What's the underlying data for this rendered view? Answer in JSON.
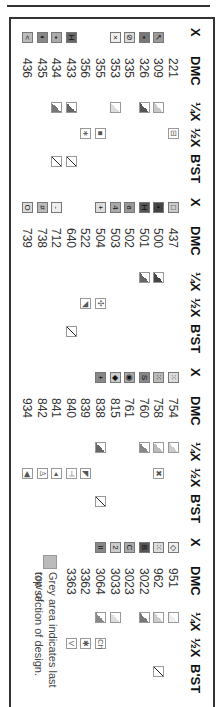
{
  "headers": {
    "x": "X",
    "dmc": "DMC",
    "quarter": "¼X",
    "half": "½X",
    "bst": "B'ST"
  },
  "groups": [
    {
      "rows": [
        {
          "dmc": "221",
          "x": null,
          "x_bg": null,
          "q": null,
          "h": "⊟",
          "b": false
        },
        {
          "dmc": "309",
          "x": "↖",
          "x_bg": "#9a9a9a",
          "q": "#c8c8c8",
          "h": null,
          "b": false
        },
        {
          "dmc": "326",
          "x": "•",
          "x_bg": "#777",
          "q": "#555",
          "h": null,
          "b": false
        },
        {
          "dmc": "335",
          "x": "⊘",
          "x_bg": "#ddd",
          "q": null,
          "h": null,
          "b": false
        },
        {
          "dmc": "353",
          "x": "×",
          "x_bg": "#eee",
          "q": "#ddd",
          "h": null,
          "b": false
        },
        {
          "dmc": "355",
          "x": null,
          "x_bg": null,
          "q": null,
          "h": "■",
          "b": false
        },
        {
          "dmc": "356",
          "x": null,
          "x_bg": null,
          "q": null,
          "h": "∗",
          "b": false
        },
        {
          "dmc": "433",
          "x": "H",
          "x_bg": "#666",
          "q": "#666",
          "h": null,
          "b": true
        },
        {
          "dmc": "434",
          "x": "•",
          "x_bg": "#aaa",
          "q": "#777",
          "h": null,
          "b": true
        },
        {
          "dmc": "435",
          "x": "◐",
          "x_bg": "#888",
          "q": null,
          "h": null,
          "b": false
        },
        {
          "dmc": "436",
          "x": "<",
          "x_bg": "#bbb",
          "q": null,
          "h": null,
          "b": false
        }
      ]
    },
    {
      "rows": [
        {
          "dmc": "437",
          "x": "□",
          "x_bg": "#ccc",
          "q": null,
          "h": null,
          "b": false
        },
        {
          "dmc": "500",
          "x": "▪",
          "x_bg": "#444",
          "q": "#444",
          "h": null,
          "b": false
        },
        {
          "dmc": "501",
          "x": "H",
          "x_bg": "#555",
          "q": "#666",
          "h": null,
          "b": false
        },
        {
          "dmc": "502",
          "x": "ɞ",
          "x_bg": "#999",
          "q": null,
          "h": null,
          "b": false
        },
        {
          "dmc": "503",
          "x": "4",
          "x_bg": "#aaa",
          "q": null,
          "h": null,
          "b": false
        },
        {
          "dmc": "504",
          "x": "+",
          "x_bg": "#ddd",
          "q": null,
          "h": "✣",
          "b": false
        },
        {
          "dmc": "522",
          "x": null,
          "x_bg": null,
          "q": null,
          "h": "◥",
          "b": false
        },
        {
          "dmc": "640",
          "x": null,
          "x_bg": null,
          "q": null,
          "h": null,
          "b": true
        },
        {
          "dmc": "712",
          "x": "-",
          "x_bg": "#eee",
          "q": null,
          "h": null,
          "b": false
        },
        {
          "dmc": "738",
          "x": "#",
          "x_bg": "#bbb",
          "q": null,
          "h": null,
          "b": false
        },
        {
          "dmc": "739",
          "x": "O",
          "x_bg": "#ddd",
          "q": null,
          "h": null,
          "b": false
        }
      ]
    },
    {
      "rows": [
        {
          "dmc": "754",
          "x": "⁙",
          "x_bg": "#ddd",
          "q": "#ccc",
          "h": null,
          "b": false
        },
        {
          "dmc": "758",
          "x": "⁙",
          "x_bg": "#bbb",
          "q": "#bbb",
          "h": "✖",
          "b": false
        },
        {
          "dmc": "760",
          "x": "S",
          "x_bg": "#888",
          "q": "#888",
          "h": null,
          "b": false
        },
        {
          "dmc": "761",
          "x": "◉",
          "x_bg": "#aaa",
          "q": null,
          "h": null,
          "b": false
        },
        {
          "dmc": "815",
          "x": "◆",
          "x_bg": "#ccc",
          "q": null,
          "h": null,
          "b": false
        },
        {
          "dmc": "838",
          "x": "+",
          "x_bg": "#888",
          "q": "#666",
          "h": null,
          "b": true
        },
        {
          "dmc": "839",
          "x": null,
          "x_bg": null,
          "q": null,
          "h": "◤",
          "b": false
        },
        {
          "dmc": "840",
          "x": null,
          "x_bg": null,
          "q": null,
          "h": "⊣",
          "b": false
        },
        {
          "dmc": "841",
          "x": null,
          "x_bg": null,
          "q": null,
          "h": "◂",
          "b": false
        },
        {
          "dmc": "842",
          "x": null,
          "x_bg": null,
          "q": null,
          "h": "♙",
          "b": false
        },
        {
          "dmc": "934",
          "x": null,
          "x_bg": null,
          "q": null,
          "h": "◀",
          "b": false
        }
      ]
    },
    {
      "rows": [
        {
          "dmc": "951",
          "x": "◇",
          "x_bg": "#eee",
          "q": "#eee",
          "h": null,
          "b": false
        },
        {
          "dmc": "962",
          "x": "⁙",
          "x_bg": "#ddd",
          "q": "#ccc",
          "h": null,
          "b": true
        },
        {
          "dmc": "3022",
          "x": "B",
          "x_bg": "#555",
          "q": "#777",
          "h": null,
          "b": false
        },
        {
          "dmc": "3023",
          "x": "C",
          "x_bg": "#aaa",
          "q": null,
          "h": null,
          "b": false
        },
        {
          "dmc": "3033",
          "x": "2",
          "x_bg": "#ccc",
          "q": "#ddd",
          "h": null,
          "b": false
        },
        {
          "dmc": "3064",
          "x": "II",
          "x_bg": "#888",
          "q": "#888",
          "h": "Ch",
          "b": false
        },
        {
          "dmc": "3362",
          "x": null,
          "x_bg": null,
          "q": null,
          "h": "✱",
          "b": false
        },
        {
          "dmc": "3363",
          "x": null,
          "x_bg": null,
          "q": null,
          "h": "V",
          "b": false
        }
      ]
    }
  ],
  "note": {
    "line1": "Grey area indicates last row of",
    "line2": "top section of design.",
    "swatch_color": "#bbbbbb"
  }
}
